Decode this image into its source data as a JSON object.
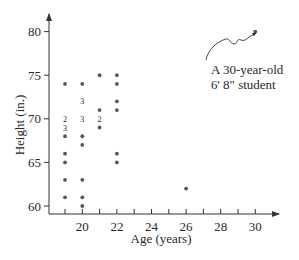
{
  "chart_data": {
    "type": "scatter",
    "title": "",
    "xlabel": "Age (years)",
    "ylabel": "Height (in.)",
    "xlim": [
      18,
      31
    ],
    "ylim": [
      59.2,
      82
    ],
    "grid": false,
    "legend": null,
    "x_ticks": [
      20,
      22,
      24,
      26,
      28,
      30
    ],
    "x_minor_ticks": [
      19,
      20,
      21,
      22,
      23,
      24,
      25,
      26,
      27,
      28,
      29,
      30
    ],
    "y_ticks": [
      60,
      65,
      70,
      75,
      80
    ],
    "points": [
      {
        "x": 19,
        "y": 74,
        "count": 1
      },
      {
        "x": 19,
        "y": 70,
        "count": 2
      },
      {
        "x": 19,
        "y": 69,
        "count": 3
      },
      {
        "x": 19,
        "y": 68,
        "count": 1
      },
      {
        "x": 19,
        "y": 66,
        "count": 1
      },
      {
        "x": 19,
        "y": 65,
        "count": 1
      },
      {
        "x": 19,
        "y": 63,
        "count": 1
      },
      {
        "x": 19,
        "y": 61,
        "count": 1
      },
      {
        "x": 20,
        "y": 74,
        "count": 1
      },
      {
        "x": 20,
        "y": 72,
        "count": 3
      },
      {
        "x": 20,
        "y": 70,
        "count": 3
      },
      {
        "x": 20,
        "y": 68,
        "count": 1
      },
      {
        "x": 20,
        "y": 67,
        "count": 1
      },
      {
        "x": 20,
        "y": 63,
        "count": 1
      },
      {
        "x": 20,
        "y": 61,
        "count": 1
      },
      {
        "x": 20,
        "y": 60,
        "count": 1
      },
      {
        "x": 21,
        "y": 75,
        "count": 1
      },
      {
        "x": 21,
        "y": 71,
        "count": 1
      },
      {
        "x": 21,
        "y": 70,
        "count": 2
      },
      {
        "x": 21,
        "y": 69,
        "count": 1
      },
      {
        "x": 22,
        "y": 75,
        "count": 1
      },
      {
        "x": 22,
        "y": 74,
        "count": 1
      },
      {
        "x": 22,
        "y": 72,
        "count": 1
      },
      {
        "x": 22,
        "y": 71,
        "count": 1
      },
      {
        "x": 22,
        "y": 66,
        "count": 1
      },
      {
        "x": 22,
        "y": 65,
        "count": 1
      },
      {
        "x": 26,
        "y": 62,
        "count": 1
      },
      {
        "x": 30,
        "y": 80,
        "count": 1
      }
    ],
    "annotations": [
      {
        "text_lines": [
          "A 30-year-old",
          "6' 8\" student"
        ],
        "points_to": {
          "x": 30,
          "y": 80
        }
      }
    ],
    "note": "Numbers beside positions indicate multiple students with the same age and height"
  },
  "colors": {
    "axis": "#333333",
    "point": "#555555",
    "text": "#2a2a2a",
    "background": "#ffffff"
  }
}
